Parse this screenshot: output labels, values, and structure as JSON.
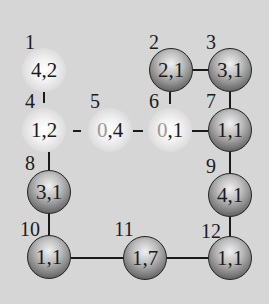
{
  "diagram": {
    "background": "#d6d6d6",
    "nodes": [
      {
        "id": "1",
        "label": "1",
        "value": "4,2",
        "a": "4",
        "b": "2",
        "style": "ghost",
        "x": 44,
        "y": 70
      },
      {
        "id": "2",
        "label": "2",
        "value": "2,1",
        "a": "2",
        "b": "1",
        "style": "dark",
        "x": 171,
        "y": 70
      },
      {
        "id": "3",
        "label": "3",
        "value": "3,1",
        "a": "3",
        "b": "1",
        "style": "dark",
        "x": 230,
        "y": 70
      },
      {
        "id": "4",
        "label": "4",
        "value": "1,2",
        "a": "1",
        "b": "2",
        "style": "ghost",
        "x": 44,
        "y": 130
      },
      {
        "id": "5",
        "label": "5",
        "value": "0,4",
        "a": "0",
        "b": "4",
        "style": "ghost",
        "x": 110,
        "y": 130
      },
      {
        "id": "6",
        "label": "6",
        "value": "0,1",
        "a": "0",
        "b": "1",
        "style": "ghost",
        "x": 170,
        "y": 130
      },
      {
        "id": "7",
        "label": "7",
        "value": "1,1",
        "a": "1",
        "b": "1",
        "style": "dark",
        "x": 230,
        "y": 130
      },
      {
        "id": "8",
        "label": "8",
        "value": "3,1",
        "a": "3",
        "b": "1",
        "style": "dark",
        "x": 49,
        "y": 192
      },
      {
        "id": "9",
        "label": "9",
        "value": "4,1",
        "a": "4",
        "b": "1",
        "style": "dark",
        "x": 230,
        "y": 195
      },
      {
        "id": "10",
        "label": "10",
        "value": "1,1",
        "a": "1",
        "b": "1",
        "style": "dark",
        "x": 49,
        "y": 257
      },
      {
        "id": "11",
        "label": "11",
        "value": "1,7",
        "a": "1",
        "b": "7",
        "style": "dark",
        "x": 145,
        "y": 258
      },
      {
        "id": "12",
        "label": "12",
        "value": "1,1",
        "a": "1",
        "b": "1",
        "style": "dark",
        "x": 230,
        "y": 258
      }
    ],
    "edges": [
      {
        "from": "1",
        "to": "4"
      },
      {
        "from": "2",
        "to": "3"
      },
      {
        "from": "2",
        "to": "6"
      },
      {
        "from": "3",
        "to": "7"
      },
      {
        "from": "4",
        "to": "5"
      },
      {
        "from": "5",
        "to": "6"
      },
      {
        "from": "6",
        "to": "7"
      },
      {
        "from": "4",
        "to": "8"
      },
      {
        "from": "7",
        "to": "9"
      },
      {
        "from": "8",
        "to": "10"
      },
      {
        "from": "9",
        "to": "12"
      },
      {
        "from": "10",
        "to": "11"
      },
      {
        "from": "11",
        "to": "12"
      }
    ]
  }
}
